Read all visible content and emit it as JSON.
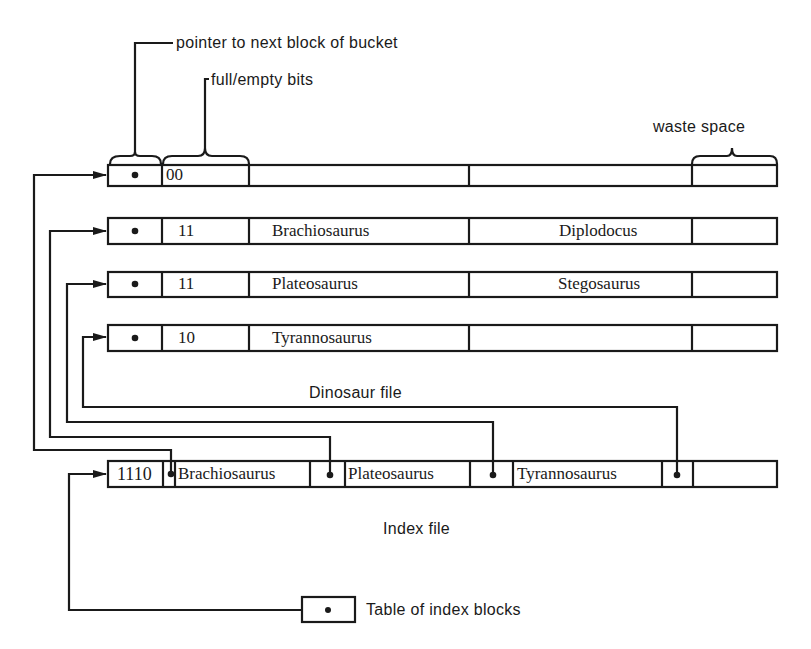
{
  "annotations": {
    "pointer_label": "pointer to next block of bucket",
    "bits_label": "full/empty bits",
    "waste_label": "waste space"
  },
  "dinosaur_file": {
    "caption": "Dinosaur file",
    "blocks": [
      {
        "pointer": "•",
        "bits": "00",
        "records": [
          "",
          ""
        ]
      },
      {
        "pointer": "•",
        "bits": "11",
        "records": [
          "Brachiosaurus",
          "Diplodocus"
        ]
      },
      {
        "pointer": "•",
        "bits": "11",
        "records": [
          "Plateosaurus",
          "Stegosaurus"
        ]
      },
      {
        "pointer": "•",
        "bits": "10",
        "records": [
          "Tyrannosaurus",
          ""
        ]
      }
    ]
  },
  "index_file": {
    "caption": "Index file",
    "bits": "1110",
    "entries": [
      {
        "key": "Brachiosaurus",
        "pointer": "•"
      },
      {
        "key": "Plateosaurus",
        "pointer": "•"
      },
      {
        "key": "Tyrannosaurus",
        "pointer": "•"
      }
    ]
  },
  "table_of_index_blocks": {
    "pointer": "•",
    "label": "Table of index blocks"
  },
  "colors": {
    "ink": "#1a1a1a",
    "background": "#ffffff"
  }
}
